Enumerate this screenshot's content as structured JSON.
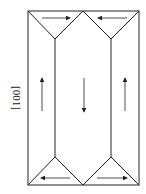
{
  "diagram": {
    "axis_label": "[001]",
    "domains": [
      {
        "name": "top-left-closure",
        "arrow": "right"
      },
      {
        "name": "top-right-closure",
        "arrow": "left"
      },
      {
        "name": "left-body",
        "arrow": "up"
      },
      {
        "name": "center-body",
        "arrow": "down"
      },
      {
        "name": "right-body",
        "arrow": "up"
      },
      {
        "name": "bottom-left-closure",
        "arrow": "left"
      },
      {
        "name": "bottom-right-closure",
        "arrow": "right"
      }
    ],
    "colors": {
      "line": "#222222",
      "background": "#ffffff"
    }
  }
}
